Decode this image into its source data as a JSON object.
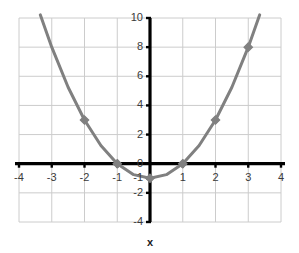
{
  "chart_data": {
    "type": "line",
    "title": "",
    "subtitle": "",
    "equation": "y = x^2 - 1",
    "xlabel": "x",
    "ylabel": "",
    "xlim": [
      -4,
      4
    ],
    "ylim": [
      -4,
      10
    ],
    "grid": true,
    "legend": false,
    "legend_position": "none",
    "x_ticks": [
      -4,
      -3,
      -2,
      -1,
      0,
      1,
      2,
      3,
      4
    ],
    "x_tick_labels": [
      "-4",
      "-3",
      "-2",
      "-1",
      "0",
      "1",
      "2",
      "3",
      "4"
    ],
    "y_ticks": [
      -4,
      -2,
      -1,
      0,
      2,
      4,
      6,
      8,
      10
    ],
    "y_tick_labels": [
      "-4",
      "-2",
      "-1",
      "0",
      "2",
      "4",
      "6",
      "8",
      "10"
    ],
    "x_gridlines": [
      -4,
      -3,
      -2,
      -1,
      0,
      1,
      2,
      3,
      4
    ],
    "y_gridlines": [
      -4,
      -2,
      0,
      2,
      4,
      6,
      8,
      10
    ],
    "series": [
      {
        "name": "y = x^2 - 1",
        "color": "#808080",
        "line_width": 3,
        "marker": "diamond",
        "marker_color": "#808080",
        "x": [
          -3.35,
          -3,
          -2.5,
          -2,
          -1.5,
          -1,
          -0.5,
          0,
          0.5,
          1,
          1.5,
          2,
          2.5,
          3,
          3.35
        ],
        "y": [
          10.22,
          8,
          5.25,
          3,
          1.25,
          0,
          -0.75,
          -1,
          -0.75,
          0,
          1.25,
          3,
          5.25,
          8,
          10.22
        ],
        "marked_points": [
          {
            "x": -2,
            "y": 3
          },
          {
            "x": -1,
            "y": 0
          },
          {
            "x": 0,
            "y": -1
          },
          {
            "x": 1,
            "y": 0
          },
          {
            "x": 2,
            "y": 3
          },
          {
            "x": 3,
            "y": 8
          }
        ]
      }
    ],
    "colors": {
      "curve": "#808080",
      "marker": "#808080",
      "axis": "#000000",
      "grid": "#cccccc",
      "tick_text": "#3a3a3a",
      "background": "#ffffff"
    }
  },
  "axes": {
    "x_title": "x"
  }
}
